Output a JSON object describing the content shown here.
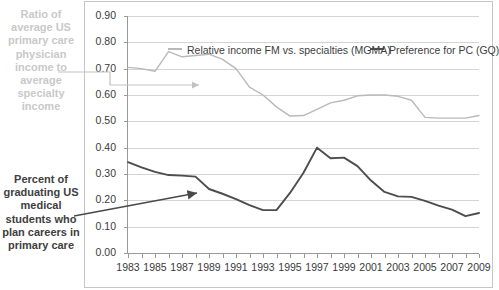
{
  "annotations": {
    "left_top": "Ratio of average US primary care physician income to average specialty income",
    "left_bottom": "Percent of graduating US medical students who plan careers in primary care"
  },
  "legend": {
    "entries": [
      {
        "label": "Relative income FM vs. specialties (MGMA)",
        "color": "#b9b9b9"
      },
      {
        "label": "Preference for PC (GQ)",
        "color": "#4d4d4d"
      }
    ]
  },
  "axis": {
    "y_labels": [
      "0.90",
      "0.80",
      "0.70",
      "0.60",
      "0.50",
      "0.40",
      "0.30",
      "0.20",
      "0.10",
      "0.00"
    ],
    "x_labels": [
      "1983",
      "1985",
      "1987",
      "1989",
      "1991",
      "1993",
      "1995",
      "1997",
      "1999",
      "2001",
      "2003",
      "2005",
      "2007",
      "2009"
    ]
  },
  "chart_data": {
    "type": "line",
    "title": "",
    "xlabel": "",
    "ylabel": "",
    "xlim": [
      1983,
      2009
    ],
    "ylim": [
      0.0,
      0.9
    ],
    "grid": true,
    "legend_position": "top-inside",
    "x": [
      1983,
      1984,
      1985,
      1986,
      1987,
      1988,
      1989,
      1990,
      1991,
      1992,
      1993,
      1994,
      1995,
      1996,
      1997,
      1998,
      1999,
      2000,
      2001,
      2002,
      2003,
      2004,
      2005,
      2006,
      2007,
      2008,
      2009
    ],
    "series": [
      {
        "name": "Relative income FM vs. specialties (MGMA)",
        "color": "#b9b9b9",
        "values": [
          0.705,
          0.7,
          0.69,
          0.765,
          0.745,
          0.75,
          0.755,
          0.735,
          0.7,
          0.63,
          0.6,
          0.555,
          0.52,
          0.522,
          0.545,
          0.57,
          0.58,
          0.597,
          0.6,
          0.6,
          0.595,
          0.58,
          0.515,
          0.512,
          0.512,
          0.512,
          0.522
        ]
      },
      {
        "name": "Preference for PC (GQ)",
        "color": "#4d4d4d",
        "values": [
          0.345,
          0.325,
          0.308,
          0.296,
          0.294,
          0.29,
          0.243,
          0.225,
          0.205,
          0.182,
          0.163,
          0.163,
          0.228,
          0.305,
          0.4,
          0.36,
          0.362,
          0.33,
          0.275,
          0.232,
          0.215,
          0.213,
          0.198,
          0.18,
          0.165,
          0.14,
          0.152
        ]
      }
    ]
  }
}
